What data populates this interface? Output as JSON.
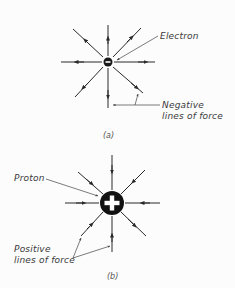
{
  "figure_a": {
    "charge_label": "Electron",
    "charge_symbol": "−",
    "lines_label_1": "Negative",
    "lines_label_2": "lines of force",
    "caption": "(a)"
  },
  "figure_b": {
    "charge_label": "Proton",
    "charge_symbol": "+",
    "lines_label_1": "Positive",
    "lines_label_2": "lines of force",
    "caption": "(b)"
  },
  "colors": {
    "ink": "#2a2a2a",
    "background": "#fcfcfc"
  }
}
